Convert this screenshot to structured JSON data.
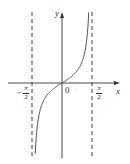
{
  "chart_data": {
    "type": "line",
    "title": "",
    "function": "y = tan x",
    "xlabel": "x",
    "ylabel": "y",
    "origin_label": "0",
    "x_tick_labels": [
      {
        "value": -1.5708,
        "label": "-π/2",
        "numerator": "π",
        "denominator": "2",
        "sign": "−"
      },
      {
        "value": 1.5708,
        "label": "π/2",
        "numerator": "π",
        "denominator": "2",
        "sign": ""
      }
    ],
    "asymptotes": [
      -1.5708,
      1.5708
    ],
    "asymptote_style": "dashed",
    "xlim": [
      -2.2,
      2.4
    ],
    "ylim": [
      -6,
      6
    ],
    "grid": false,
    "legend": null,
    "series": [
      {
        "name": "tan x",
        "x": [
          -1.4,
          -1.3,
          -1.2,
          -1.0,
          -0.8,
          -0.6,
          -0.4,
          -0.2,
          0,
          0.2,
          0.4,
          0.6,
          0.8,
          1.0,
          1.2,
          1.3,
          1.4
        ],
        "y": [
          -5.8,
          -3.6,
          -2.57,
          -1.56,
          -1.03,
          -0.68,
          -0.42,
          -0.2,
          0,
          0.2,
          0.42,
          0.68,
          1.03,
          1.56,
          2.57,
          3.6,
          5.8
        ]
      }
    ]
  },
  "colors": {
    "axis": "#333333",
    "curve": "#555555",
    "asymptote": "#444444",
    "background": "#ffffff"
  }
}
